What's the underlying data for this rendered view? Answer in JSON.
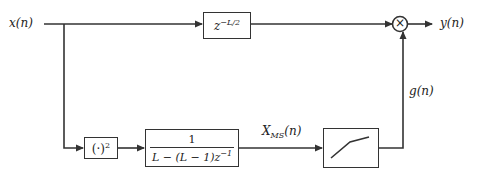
{
  "diagram": {
    "type": "signal-flow block diagram",
    "input": {
      "label": "x(n)"
    },
    "output": {
      "label": "y(n)"
    },
    "blocks": {
      "delay": {
        "label_base": "z",
        "label_exp": "−L/2"
      },
      "square": {
        "label_base": "(·)",
        "label_exp": "2"
      },
      "averager": {
        "numerator": "1",
        "denominator_base": "L − (L − 1)z",
        "denominator_exp": "−1"
      },
      "nonlinearity": {
        "icon": "piecewise-linear-gain-curve"
      },
      "multiplier": {
        "symbol": "×"
      }
    },
    "signals": {
      "mean_square": {
        "base": "X",
        "sub": "MS",
        "suffix": "(n)"
      },
      "gain": {
        "label": "g(n)"
      }
    },
    "colors": {
      "line": "#333333",
      "background": "#ffffff"
    }
  }
}
